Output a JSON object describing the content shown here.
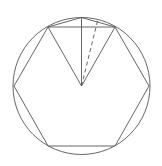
{
  "diagram": {
    "stroke_color": "#555555",
    "circle": {
      "cx": 81.5,
      "cy": 86,
      "r": 68.5
    },
    "hexagon_points": "48,27 115,27 149,86 115,146 48,146 14,86",
    "center": {
      "x": 81.5,
      "y": 86
    },
    "top_point": {
      "x": 81.5,
      "y": 17.5
    },
    "dashed_end": {
      "x": 98,
      "y": 19
    }
  }
}
